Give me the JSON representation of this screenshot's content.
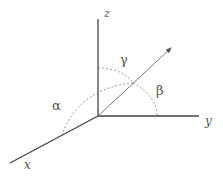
{
  "diagram": {
    "axes": {
      "x": {
        "label": "x"
      },
      "y": {
        "label": "y"
      },
      "z": {
        "label": "z"
      }
    },
    "angles": {
      "alpha": {
        "label": "α",
        "between": "vector and x-axis"
      },
      "beta": {
        "label": "β",
        "between": "vector and y-axis"
      },
      "gamma": {
        "label": "γ",
        "between": "vector and z-axis"
      }
    },
    "colors": {
      "axis": "#444444",
      "vector": "#666666",
      "arc": "#888888",
      "text": "#555555",
      "background": "#ffffff"
    }
  }
}
